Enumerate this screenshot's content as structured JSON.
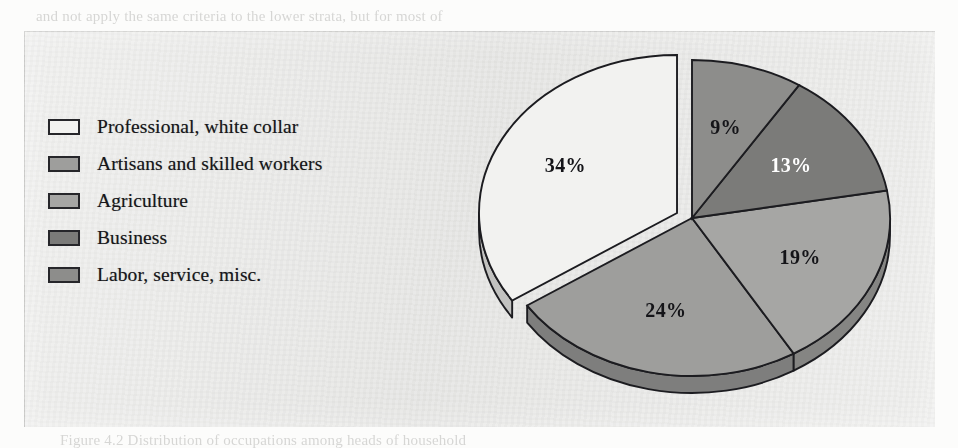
{
  "page": {
    "ghost_text": [
      {
        "text": "and not apply the same criteria to the lower strata, but for most of",
        "x": 36,
        "y": 8
      },
      {
        "text": "tional levels, a consistent pattern of variation would become evident",
        "x": 36,
        "y": 30
      },
      {
        "text": "present. Thus, among the professionals, nearly one-half were in the",
        "x": 56,
        "y": 52
      },
      {
        "text": "the 'professional' literature, while another quarter were teachers,",
        "x": 56,
        "y": 74
      },
      {
        "text": "the remainder were engaged in the higher levels of commerce.",
        "x": 56,
        "y": 96
      },
      {
        "text": "Occupational Structure and Mobility",
        "x": 430,
        "y": 150
      },
      {
        "text": "Occupational structure was not a matter of consequence in itself, but",
        "x": 420,
        "y": 196
      },
      {
        "text": "determined, the social relations of the community as a whole, and",
        "x": 420,
        "y": 218
      },
      {
        "text": "standing of the family and the place of the individual within it.",
        "x": 420,
        "y": 240
      },
      {
        "text": "community, as it were, made up of a wealth of variation in the level of",
        "x": 420,
        "y": 262
      },
      {
        "text": "occupational structure was by no means uniform across the region,",
        "x": 420,
        "y": 284
      },
      {
        "text": "and the comparative figures are in the table opposite, which showed the",
        "x": 420,
        "y": 306
      },
      {
        "text": "following distribution of occupations among the heads of household",
        "x": 36,
        "y": 368
      },
      {
        "text": "in the district during the period under consideration here, namely:",
        "x": 36,
        "y": 404
      },
      {
        "text": "Figure 4.2 Distribution of occupations among heads of household",
        "x": 60,
        "y": 432
      }
    ]
  },
  "figure": {
    "legend_title": "",
    "legend": [
      {
        "label": "Professional, white collar",
        "color": "#f2f2f0",
        "swatch_name": "legend-swatch-professional"
      },
      {
        "label": "Artisans and skilled workers",
        "color": "#9e9e9c",
        "swatch_name": "legend-swatch-artisans"
      },
      {
        "label": "Agriculture",
        "color": "#a6a6a4",
        "swatch_name": "legend-swatch-agriculture"
      },
      {
        "label": "Business",
        "color": "#7b7b79",
        "swatch_name": "legend-swatch-business"
      },
      {
        "label": "Labor, service, misc.",
        "color": "#8d8d8b",
        "swatch_name": "legend-swatch-labor"
      }
    ]
  },
  "chart_data": {
    "type": "pie",
    "title": "",
    "xlabel": "",
    "ylabel": "",
    "unit": "%",
    "total": 99,
    "exploded_slice": "Professional, white collar",
    "three_d": true,
    "start_angle_deg": 90,
    "direction": "counterclockwise",
    "categories": [
      "Professional, white collar",
      "Artisans and skilled workers",
      "Agriculture",
      "Business",
      "Labor, service, misc."
    ],
    "values": [
      34,
      24,
      19,
      13,
      9
    ],
    "labels": [
      "34%",
      "24%",
      "19%",
      "13%",
      "9%"
    ],
    "label_colors": [
      "dark",
      "dark",
      "dark",
      "light",
      "dark"
    ],
    "slice_colors": [
      "#f2f2f0",
      "#9e9e9c",
      "#a6a6a4",
      "#7b7b79",
      "#8d8d8b"
    ],
    "slices": [
      {
        "category": "Professional, white collar",
        "value": 34,
        "label": "34%",
        "color": "#f2f2f0",
        "label_color": "dark",
        "exploded": true
      },
      {
        "category": "Artisans and skilled workers",
        "value": 24,
        "label": "24%",
        "color": "#9e9e9c",
        "label_color": "dark",
        "exploded": false
      },
      {
        "category": "Agriculture",
        "value": 19,
        "label": "19%",
        "color": "#a6a6a4",
        "label_color": "dark",
        "exploded": false
      },
      {
        "category": "Business",
        "value": 13,
        "label": "13%",
        "color": "#7b7b79",
        "label_color": "light",
        "exploded": false
      },
      {
        "category": "Labor, service, misc.",
        "value": 9,
        "label": "9%",
        "color": "#8d8d8b",
        "label_color": "dark",
        "exploded": false
      }
    ],
    "legend_position": "left",
    "grid": false
  }
}
